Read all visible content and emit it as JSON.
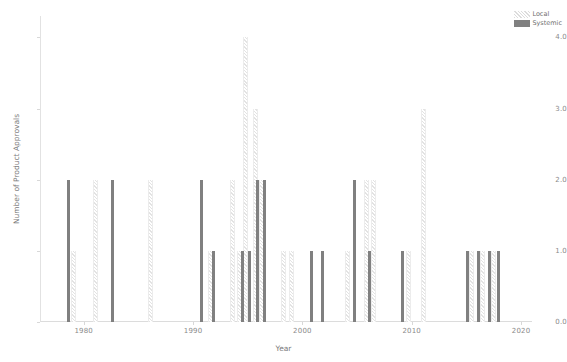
{
  "chart_data": {
    "type": "bar",
    "title": "",
    "xlabel": "Year",
    "ylabel": "Number of Product Approvals",
    "xlim": [
      1976,
      2021
    ],
    "ylim": [
      0.0,
      4.3
    ],
    "xticks": [
      "1980",
      "1990",
      "2000",
      "2010",
      "2020"
    ],
    "xtick_values": [
      1980,
      1990,
      2000,
      2010,
      2020
    ],
    "yticks": [
      "0.0",
      "1.0",
      "2.0",
      "3.0",
      "4.0"
    ],
    "ytick_values": [
      0.0,
      1.0,
      2.0,
      3.0,
      4.0
    ],
    "grid": false,
    "legend_position": "upper right",
    "colors": {
      "systemic": "#808080",
      "local": "#e3e3e3",
      "axis": "#dcdcdc",
      "text": "#8a8a8a",
      "background": "#ffffff"
    },
    "series": [
      {
        "name": "Local",
        "pattern": "hatched",
        "points": [
          {
            "x": 1979.0,
            "y": 1.0
          },
          {
            "x": 1981.0,
            "y": 2.0
          },
          {
            "x": 1986.0,
            "y": 2.0
          },
          {
            "x": 1991.5,
            "y": 1.0
          },
          {
            "x": 1993.5,
            "y": 2.0
          },
          {
            "x": 1994.2,
            "y": 1.0
          },
          {
            "x": 1994.7,
            "y": 4.0
          },
          {
            "x": 1995.6,
            "y": 3.0
          },
          {
            "x": 1996.2,
            "y": 2.0
          },
          {
            "x": 1998.2,
            "y": 1.0
          },
          {
            "x": 1998.9,
            "y": 1.0
          },
          {
            "x": 2004.0,
            "y": 1.0
          },
          {
            "x": 2005.8,
            "y": 2.0
          },
          {
            "x": 2006.4,
            "y": 2.0
          },
          {
            "x": 2009.6,
            "y": 1.0
          },
          {
            "x": 2011.0,
            "y": 3.0
          },
          {
            "x": 2015.4,
            "y": 1.0
          },
          {
            "x": 2016.4,
            "y": 1.0
          },
          {
            "x": 2017.4,
            "y": 1.0
          }
        ]
      },
      {
        "name": "Systemic",
        "pattern": "solid",
        "points": [
          {
            "x": 1978.6,
            "y": 2.0
          },
          {
            "x": 1982.6,
            "y": 2.0
          },
          {
            "x": 1990.8,
            "y": 2.0
          },
          {
            "x": 1991.9,
            "y": 1.0
          },
          {
            "x": 1994.5,
            "y": 1.0
          },
          {
            "x": 1995.2,
            "y": 1.0
          },
          {
            "x": 1995.9,
            "y": 2.0
          },
          {
            "x": 1996.5,
            "y": 2.0
          },
          {
            "x": 2000.8,
            "y": 1.0
          },
          {
            "x": 2001.8,
            "y": 1.0
          },
          {
            "x": 2004.8,
            "y": 2.0
          },
          {
            "x": 2006.1,
            "y": 1.0
          },
          {
            "x": 2009.2,
            "y": 1.0
          },
          {
            "x": 2015.1,
            "y": 1.0
          },
          {
            "x": 2016.1,
            "y": 1.0
          },
          {
            "x": 2017.1,
            "y": 1.0
          },
          {
            "x": 2017.9,
            "y": 1.0
          }
        ]
      }
    ]
  },
  "legend": {
    "items": [
      {
        "label": "Local",
        "key": "local"
      },
      {
        "label": "Systemic",
        "key": "systemic"
      }
    ]
  }
}
